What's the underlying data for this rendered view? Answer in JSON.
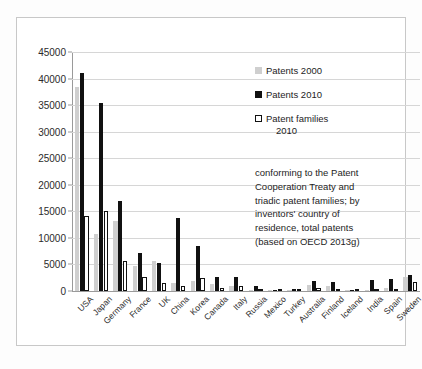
{
  "chart_data": {
    "type": "bar",
    "title": "",
    "xlabel": "",
    "ylabel": "",
    "ylim": [
      0,
      45000
    ],
    "ytick_step": 5000,
    "yticks": [
      45000,
      40000,
      35000,
      30000,
      25000,
      20000,
      15000,
      10000,
      5000,
      0
    ],
    "ytick_labels": [
      "45000",
      "40000",
      "35000",
      "30000",
      "25000",
      "20000",
      "15000",
      "10000",
      "5000",
      "0"
    ],
    "grid": true,
    "legend_position": "top-right",
    "categories": [
      "USA",
      "Japan",
      "Germany",
      "France",
      "UK",
      "China",
      "Korea",
      "Canada",
      "Italy",
      "Russia",
      "Mexico",
      "Turkey",
      "Australia",
      "Finland",
      "Iceland",
      "India",
      "Spain",
      "Sweden"
    ],
    "series": [
      {
        "name": "Patents 2000",
        "color": "#cfcfcf",
        "values": [
          38500,
          10800,
          13200,
          4700,
          5700,
          1500,
          1900,
          1300,
          900,
          250,
          120,
          150,
          1100,
          900,
          60,
          130,
          600,
          2600
        ]
      },
      {
        "name": "Patents 2010",
        "color": "#111111",
        "values": [
          41000,
          35400,
          17000,
          7100,
          5200,
          13800,
          8500,
          2700,
          2700,
          1000,
          200,
          350,
          1800,
          1700,
          120,
          2100,
          2200,
          3000
        ]
      },
      {
        "name": "Patent families 2010",
        "color": "#ffffff",
        "values": [
          14200,
          15100,
          5700,
          2600,
          1600,
          900,
          2400,
          600,
          900,
          200,
          60,
          100,
          500,
          400,
          40,
          200,
          400,
          1700
        ]
      }
    ],
    "annotation": [
      "conforming to the Patent",
      "Cooperation Treaty and",
      "triadic patent families; by",
      "inventors' country of",
      "residence, total patents",
      "(based on OECD 2013g)"
    ]
  },
  "legend": {
    "entries": [
      {
        "label": "Patents 2000",
        "label2": ""
      },
      {
        "label": "Patents 2010",
        "label2": ""
      },
      {
        "label": "Patent families",
        "label2": "2010"
      }
    ]
  }
}
